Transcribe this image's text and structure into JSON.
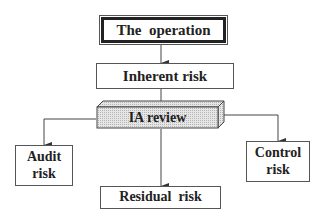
{
  "diagram": {
    "type": "flowchart",
    "nodes": [
      {
        "id": "operation",
        "label": "The  operation",
        "style": "double-border"
      },
      {
        "id": "inherent",
        "label": "Inherent risk",
        "style": "box"
      },
      {
        "id": "ia_review",
        "label": "IA review",
        "style": "3d-shaded-block"
      },
      {
        "id": "audit",
        "label": "Audit risk",
        "lines": [
          "Audit",
          "risk"
        ],
        "style": "box"
      },
      {
        "id": "control",
        "label": "Control risk",
        "lines": [
          "Control",
          "risk"
        ],
        "style": "box"
      },
      {
        "id": "residual",
        "label": "Residual  risk",
        "style": "box"
      }
    ],
    "edges": [
      {
        "from": "operation",
        "to": "inherent"
      },
      {
        "from": "inherent",
        "to": "ia_review"
      },
      {
        "from": "ia_review",
        "to": "audit"
      },
      {
        "from": "ia_review",
        "to": "residual"
      },
      {
        "from": "ia_review",
        "to": "control"
      }
    ]
  },
  "colors": {
    "line": "#444444",
    "text": "#222222",
    "shade": "#d8d8d8"
  }
}
